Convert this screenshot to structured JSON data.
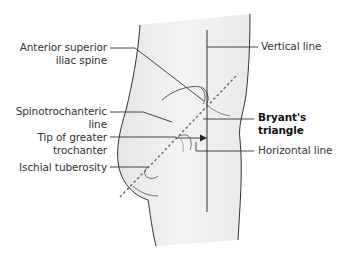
{
  "figure": {
    "title": "Bryant's triangle",
    "colors": {
      "skin_fill": "#eeeeee",
      "outline": "#333333",
      "text": "#333333",
      "background": "#ffffff"
    }
  },
  "labels": {
    "left": [
      {
        "id": "asis",
        "line1": "Anterior superior",
        "line2": "iliac spine"
      },
      {
        "id": "spinotrochanteric",
        "line1": "Spinotrochanteric",
        "line2": "line"
      },
      {
        "id": "greater-trochanter",
        "line1": "Tip of greater",
        "line2": "trochanter"
      },
      {
        "id": "ischial-tuberosity",
        "line1": "Ischial tuberosity",
        "line2": ""
      }
    ],
    "right": [
      {
        "id": "vertical-line",
        "line1": "Vertical line",
        "line2": ""
      },
      {
        "id": "bryants-triangle",
        "line1": "Bryant's",
        "line2": "triangle",
        "bold": true
      },
      {
        "id": "horizontal-line",
        "line1": "Horizontal line",
        "line2": ""
      }
    ]
  }
}
